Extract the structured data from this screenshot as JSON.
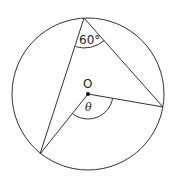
{
  "diagram": {
    "type": "circle-geometry",
    "circle": {
      "cx": 88,
      "cy": 94,
      "r": 76
    },
    "center_label": "O",
    "points": {
      "top": {
        "x": 84,
        "y": 18
      },
      "right": {
        "x": 163,
        "y": 107
      },
      "bottom_left": {
        "x": 40,
        "y": 154
      },
      "center": {
        "x": 88,
        "y": 94
      }
    },
    "angles": {
      "inscribed": {
        "label": "60°",
        "vertex": "top"
      },
      "central": {
        "label": "θ",
        "vertex": "center"
      }
    },
    "colors": {
      "stroke": "#333333",
      "background": "#ffffff"
    }
  }
}
